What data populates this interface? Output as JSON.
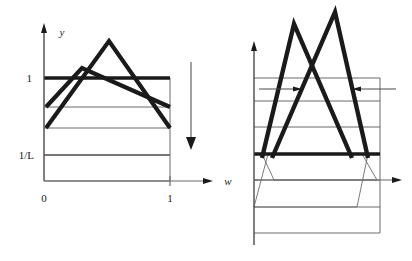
{
  "figure": {
    "title": "",
    "background_color": "#ffffff",
    "ink_color": "#1a1a1a",
    "thin_color": "#5a5a5a"
  },
  "left_panel": {
    "name": "left-plot",
    "y_axis_label": "y",
    "x_axis_label": "w",
    "y_ticks": [
      {
        "label": "1",
        "value": 1.0
      },
      {
        "label": "1/L",
        "value": 0.2
      }
    ],
    "x_ticks": [
      {
        "label": "0",
        "value": 0
      },
      {
        "label": "1",
        "value": 1
      }
    ],
    "gridlines": [
      {
        "value": 1.0,
        "weight": "thick"
      },
      {
        "value": 0.72,
        "weight": "thin"
      },
      {
        "value": 0.46,
        "weight": "thin"
      },
      {
        "value": 0.2,
        "weight": "thin"
      },
      {
        "value": 0.0,
        "weight": "thin"
      }
    ],
    "curves": [
      {
        "name": "tent-low",
        "weight": "thick",
        "points": [
          [
            0.0,
            0.72
          ],
          [
            0.3,
            1.22
          ],
          [
            1.0,
            0.72
          ]
        ]
      },
      {
        "name": "tent-high",
        "weight": "thick",
        "points": [
          [
            0.0,
            0.46
          ],
          [
            0.55,
            1.52
          ],
          [
            1.0,
            0.46
          ]
        ]
      }
    ]
  },
  "transition_arrow": {
    "name": "downward-arrow",
    "direction": "down"
  },
  "right_panel": {
    "name": "right-plot",
    "gridlines": [
      {
        "value": 1.0,
        "weight": "thin"
      },
      {
        "value": 0.86,
        "weight": "thin"
      },
      {
        "value": 0.66,
        "weight": "thin"
      },
      {
        "value": 0.46,
        "weight": "thick"
      },
      {
        "value": 0.2,
        "weight": "thin"
      },
      {
        "value": 0.0,
        "weight": "thin"
      },
      {
        "value": -0.22,
        "weight": "thin"
      }
    ],
    "curves": [
      {
        "name": "tent-left-peak",
        "weight": "thick",
        "points": [
          [
            0.05,
            0.42
          ],
          [
            0.32,
            1.72
          ],
          [
            0.72,
            0.42
          ]
        ]
      },
      {
        "name": "tent-right-peak",
        "weight": "thick",
        "points": [
          [
            0.08,
            0.42
          ],
          [
            0.52,
            1.86
          ],
          [
            0.8,
            0.42
          ]
        ]
      }
    ],
    "thin_curves": [
      {
        "name": "spread-left",
        "points": [
          [
            0.0,
            0.2
          ],
          [
            0.18,
            0.46
          ]
        ]
      },
      {
        "name": "spread-left-outer",
        "points": [
          [
            0.0,
            0.0
          ],
          [
            0.13,
            0.46
          ]
        ]
      },
      {
        "name": "spread-right",
        "points": [
          [
            0.82,
            0.46
          ],
          [
            1.0,
            0.2
          ]
        ]
      },
      {
        "name": "spread-right-outer",
        "points": [
          [
            0.8,
            0.46
          ],
          [
            0.96,
            0.0
          ]
        ]
      }
    ],
    "annotation_arrows": [
      {
        "name": "inward-arrow-left",
        "direction": "right",
        "value": 0.86
      },
      {
        "name": "inward-arrow-right",
        "direction": "left",
        "value": 0.86
      }
    ]
  }
}
